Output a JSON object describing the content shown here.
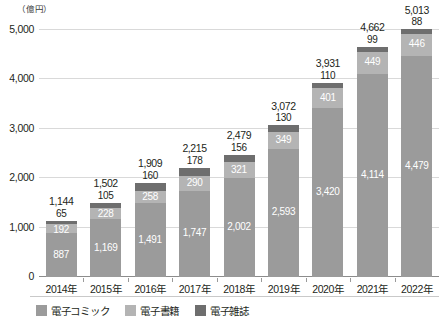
{
  "chart_data": {
    "type": "bar",
    "subtype": "stacked-vertical",
    "title": "",
    "xlabel": "",
    "ylabel": "",
    "unit_label": "（億円）",
    "categories": [
      "2014年",
      "2015年",
      "2016年",
      "2017年",
      "2018年",
      "2019年",
      "2020年",
      "2021年",
      "2022年"
    ],
    "series": [
      {
        "name": "電子コミック",
        "color": "#9b9b9b",
        "values": [
          887,
          1169,
          1491,
          1747,
          2002,
          2593,
          3420,
          4114,
          4479
        ],
        "labels": [
          "887",
          "1,169",
          "1,491",
          "1,747",
          "2,002",
          "2,593",
          "3,420",
          "4,114",
          "4,479"
        ]
      },
      {
        "name": "電子書籍",
        "color": "#b4b4b4",
        "values": [
          192,
          228,
          258,
          290,
          321,
          349,
          401,
          449,
          446
        ],
        "labels": [
          "192",
          "228",
          "258",
          "290",
          "321",
          "349",
          "401",
          "449",
          "446"
        ]
      },
      {
        "name": "電子雑誌",
        "color": "#6e6e6e",
        "values": [
          65,
          105,
          160,
          178,
          156,
          130,
          110,
          99,
          88
        ],
        "labels": [
          "65",
          "105",
          "160",
          "178",
          "156",
          "130",
          "110",
          "99",
          "88"
        ]
      }
    ],
    "totals": [
      1144,
      1502,
      1909,
      2215,
      2479,
      3072,
      3931,
      4662,
      5013
    ],
    "total_labels": [
      "1,144",
      "1,502",
      "1,909",
      "2,215",
      "2,479",
      "3,072",
      "3,931",
      "4,662",
      "5,013"
    ],
    "ylim": [
      0,
      5000
    ],
    "yticks": [
      0,
      1000,
      2000,
      3000,
      4000,
      5000
    ],
    "ytick_labels": [
      "0",
      "1,000",
      "2,000",
      "3,000",
      "4,000",
      "5,000"
    ],
    "grid": true,
    "legend_position": "bottom-left"
  },
  "legend": {
    "items": [
      {
        "label": "電子コミック",
        "color": "#9b9b9b"
      },
      {
        "label": "電子書籍",
        "color": "#b4b4b4"
      },
      {
        "label": "電子雑誌",
        "color": "#6e6e6e"
      }
    ]
  }
}
